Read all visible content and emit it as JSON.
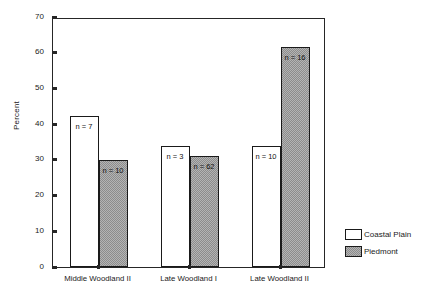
{
  "chart_data": {
    "type": "bar",
    "title": "",
    "subtitle": "",
    "xlabel": "",
    "ylabel": "Percent",
    "ylim": [
      0,
      70
    ],
    "yticks": [
      0,
      10,
      20,
      30,
      40,
      50,
      60,
      70
    ],
    "ytick_labels": [
      "0",
      "10",
      "20",
      "30",
      "40",
      "50",
      "60",
      "70"
    ],
    "grid": false,
    "legend_position": "right-bottom",
    "categories": [
      "Middle Woodland II",
      "Late Woodland I",
      "Late Woodland II"
    ],
    "series": [
      {
        "name": "Coastal Plain",
        "fill": "white",
        "color": "#ffffff",
        "values": [
          42.3,
          33.9,
          34.0
        ],
        "point_labels": [
          "n = 7",
          "n = 3",
          "n = 10"
        ]
      },
      {
        "name": "Piedmont",
        "fill": "gray-dither",
        "color": "#b4b4b4",
        "values": [
          30.0,
          31.0,
          61.6
        ],
        "point_labels": [
          "n = 10",
          "n = 62",
          "n = 16"
        ]
      }
    ],
    "annotations": [
      "n = 7",
      "n = 10",
      "n = 3",
      "n = 62",
      "n = 10",
      "n = 16"
    ]
  },
  "legend": {
    "entries": [
      {
        "label": "Coastal Plain",
        "swatch": "white-square-icon"
      },
      {
        "label": "Piedmont",
        "swatch": "gray-hatched-square-icon"
      }
    ]
  }
}
